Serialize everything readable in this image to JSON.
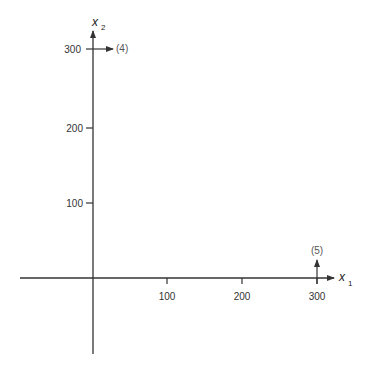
{
  "diagram": {
    "axes": {
      "x_label": "x",
      "x_subscript": "1",
      "y_label": "x",
      "y_subscript": "2",
      "x_ticks": [
        "100",
        "200",
        "300"
      ],
      "y_ticks": [
        "100",
        "200",
        "300"
      ]
    },
    "annotations": {
      "arrow_4_label": "(4)",
      "arrow_5_label": "(5)"
    },
    "colors": {
      "axis": "#333333",
      "text": "#333333"
    }
  }
}
